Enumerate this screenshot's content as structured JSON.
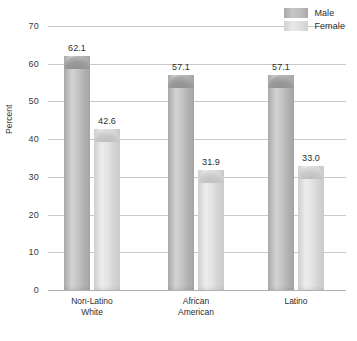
{
  "chart_data": {
    "type": "bar",
    "title": "",
    "xlabel": "",
    "ylabel": "Percent",
    "ylim": [
      0,
      70
    ],
    "yticks": [
      0,
      10,
      20,
      30,
      40,
      50,
      60,
      70
    ],
    "ytick_labels": [
      "0",
      "10",
      "20",
      "30",
      "40",
      "50",
      "60",
      "70"
    ],
    "grid": true,
    "legend_position": "top-right",
    "categories": [
      "Non-Latino White",
      "African American",
      "Latino"
    ],
    "category_lines": [
      [
        "Non-Latino",
        "White"
      ],
      [
        "African",
        "American"
      ],
      [
        "Latino",
        ""
      ]
    ],
    "series": [
      {
        "name": "Male",
        "color": "#b4b4b4",
        "values": [
          62.1,
          57.1,
          57.1
        ],
        "value_labels": [
          "62.1",
          "57.1",
          "57.1"
        ]
      },
      {
        "name": "Female",
        "color": "#dedede",
        "values": [
          42.6,
          31.9,
          33.0
        ],
        "value_labels": [
          "42.6",
          "31.9",
          "33.0"
        ]
      }
    ]
  },
  "legend": {
    "items": [
      {
        "label": "Male",
        "swatch": "male"
      },
      {
        "label": "Female",
        "swatch": "female"
      }
    ]
  },
  "axis": {
    "y_title": "Percent"
  }
}
